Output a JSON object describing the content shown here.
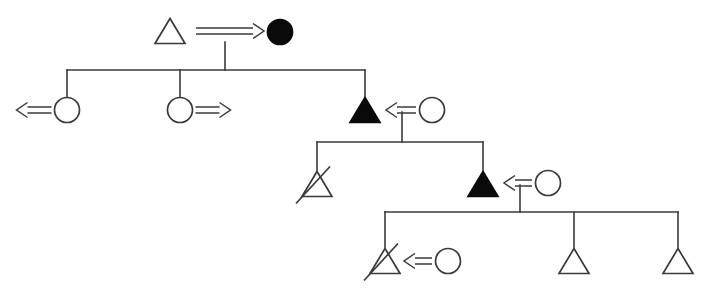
{
  "diagram": {
    "type": "pedigree",
    "width": 711,
    "height": 295,
    "background_color": "#ffffff",
    "line_color": "#3a3a3a",
    "affected_fill_color": "#0a0a0a",
    "unaffected_fill_color": "#ffffff"
  },
  "legend_semantics": {
    "triangle": "male",
    "circle": "female",
    "filled_symbol": "affected",
    "open_symbol": "unaffected",
    "diagonal_slash": "deceased",
    "double_arrow": "carrier-or-consultand-indicator"
  },
  "generations": [
    {
      "id": "generation-1",
      "label": "Generation I",
      "individuals": [
        {
          "id": "I-1",
          "shape": "triangle",
          "sex": "male",
          "affected": false,
          "deceased": false,
          "arrow": "none",
          "x": 170,
          "y": 31
        },
        {
          "id": "I-2",
          "shape": "circle",
          "sex": "female",
          "affected": true,
          "deceased": false,
          "arrow": "none",
          "x": 280,
          "y": 32
        }
      ],
      "mating_arrow": {
        "id": "arrow-I",
        "direction": "right",
        "from_x": 196,
        "to_x": 264,
        "y": 31
      }
    },
    {
      "id": "generation-2",
      "label": "Generation II",
      "individuals": [
        {
          "id": "II-1",
          "shape": "circle",
          "sex": "female",
          "affected": false,
          "deceased": false,
          "arrow": "left",
          "x": 67,
          "y": 110
        },
        {
          "id": "II-2",
          "shape": "circle",
          "sex": "female",
          "affected": false,
          "deceased": false,
          "arrow": "right",
          "x": 180,
          "y": 110
        },
        {
          "id": "II-3",
          "shape": "triangle",
          "sex": "male",
          "affected": true,
          "deceased": false,
          "arrow": "none",
          "x": 365,
          "y": 110
        },
        {
          "id": "II-4",
          "shape": "circle",
          "sex": "female",
          "affected": false,
          "deceased": false,
          "arrow": "none",
          "x": 432,
          "y": 110
        }
      ],
      "mating_arrow": {
        "id": "arrow-II",
        "direction": "left",
        "from_x": 416,
        "to_x": 386,
        "y": 110
      }
    },
    {
      "id": "generation-3",
      "label": "Generation III",
      "individuals": [
        {
          "id": "III-1",
          "shape": "triangle",
          "sex": "male",
          "affected": false,
          "deceased": true,
          "arrow": "none",
          "x": 317,
          "y": 184
        },
        {
          "id": "III-2",
          "shape": "triangle",
          "sex": "male",
          "affected": true,
          "deceased": false,
          "arrow": "none",
          "x": 483,
          "y": 184
        },
        {
          "id": "III-3",
          "shape": "circle",
          "sex": "female",
          "affected": false,
          "deceased": false,
          "arrow": "none",
          "x": 548,
          "y": 183
        }
      ],
      "mating_arrow": {
        "id": "arrow-III",
        "direction": "left",
        "from_x": 532,
        "to_x": 504,
        "y": 183
      }
    },
    {
      "id": "generation-4",
      "label": "Generation IV",
      "individuals": [
        {
          "id": "IV-1",
          "shape": "triangle",
          "sex": "male",
          "affected": false,
          "deceased": true,
          "arrow": "none",
          "x": 385,
          "y": 261
        },
        {
          "id": "IV-2",
          "shape": "circle",
          "sex": "female",
          "affected": false,
          "deceased": false,
          "arrow": "none",
          "x": 448,
          "y": 261
        },
        {
          "id": "IV-3",
          "shape": "triangle",
          "sex": "male",
          "affected": false,
          "deceased": false,
          "arrow": "none",
          "x": 574,
          "y": 261
        },
        {
          "id": "IV-4",
          "shape": "triangle",
          "sex": "male",
          "affected": false,
          "deceased": false,
          "arrow": "none",
          "x": 678,
          "y": 261
        }
      ],
      "mating_arrow": {
        "id": "arrow-IV",
        "direction": "left",
        "from_x": 432,
        "to_x": 404,
        "y": 261
      }
    }
  ],
  "connectors": [
    {
      "id": "descent-I",
      "x1": 225,
      "y1": 42,
      "x2": 225,
      "y2": 70
    },
    {
      "id": "sibship-II",
      "x1": 67,
      "y1": 70,
      "x2": 365,
      "y2": 70
    },
    {
      "id": "drop-II-1",
      "x1": 67,
      "y1": 70,
      "x2": 67,
      "y2": 98
    },
    {
      "id": "drop-II-2",
      "x1": 180,
      "y1": 70,
      "x2": 180,
      "y2": 98
    },
    {
      "id": "drop-II-3",
      "x1": 365,
      "y1": 70,
      "x2": 365,
      "y2": 96
    },
    {
      "id": "descent-II",
      "x1": 402,
      "y1": 112,
      "x2": 402,
      "y2": 142
    },
    {
      "id": "sibship-III",
      "x1": 317,
      "y1": 142,
      "x2": 483,
      "y2": 142
    },
    {
      "id": "drop-III-1",
      "x1": 317,
      "y1": 142,
      "x2": 317,
      "y2": 170
    },
    {
      "id": "drop-III-2",
      "x1": 483,
      "y1": 142,
      "x2": 483,
      "y2": 170
    },
    {
      "id": "descent-III",
      "x1": 520,
      "y1": 185,
      "x2": 520,
      "y2": 212
    },
    {
      "id": "sibship-IV",
      "x1": 385,
      "y1": 212,
      "x2": 678,
      "y2": 212
    },
    {
      "id": "drop-IV-1",
      "x1": 385,
      "y1": 212,
      "x2": 385,
      "y2": 247
    },
    {
      "id": "drop-IV-3",
      "x1": 574,
      "y1": 212,
      "x2": 574,
      "y2": 247
    },
    {
      "id": "drop-IV-4",
      "x1": 678,
      "y1": 212,
      "x2": 678,
      "y2": 247
    }
  ]
}
